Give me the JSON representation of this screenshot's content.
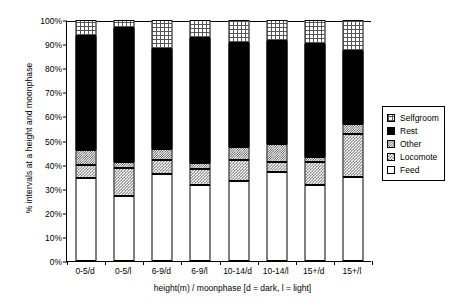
{
  "chart_data": {
    "type": "bar",
    "stacked": true,
    "title": "",
    "xlabel": "height(m) / moonphase [d = dark, l = light]",
    "ylabel": "% intervals at a height and moonphase",
    "ylim": [
      0,
      100
    ],
    "ytick_labels": [
      "0%",
      "10%",
      "20%",
      "30%",
      "40%",
      "50%",
      "60%",
      "70%",
      "80%",
      "90%",
      "100%"
    ],
    "ytick_values": [
      0,
      10,
      20,
      30,
      40,
      50,
      60,
      70,
      80,
      90,
      100
    ],
    "grid": false,
    "legend_position": "right",
    "categories": [
      "0-5/d",
      "0-5/l",
      "6-9/d",
      "6-9/l",
      "10-14/d",
      "10-14/l",
      "15+/d",
      "15+/l"
    ],
    "series": [
      {
        "name": "Feed",
        "order": 1,
        "pattern": "open-white",
        "values": [
          34.5,
          27.0,
          36.0,
          31.5,
          33.0,
          37.0,
          31.5,
          35.0
        ]
      },
      {
        "name": "Locomote",
        "order": 2,
        "pattern": "light-checker",
        "values": [
          5.5,
          11.5,
          6.0,
          6.5,
          9.0,
          4.0,
          9.5,
          17.5
        ]
      },
      {
        "name": "Other",
        "order": 3,
        "pattern": "dark-checker",
        "values": [
          6.0,
          2.5,
          4.5,
          2.5,
          5.5,
          7.5,
          2.0,
          4.5
        ]
      },
      {
        "name": "Rest",
        "order": 4,
        "pattern": "solid-black",
        "values": [
          47.4,
          55.5,
          41.5,
          52.0,
          43.0,
          43.0,
          47.0,
          30.0
        ]
      },
      {
        "name": "Selfgroom",
        "order": 5,
        "pattern": "grid-crosshatch",
        "values": [
          6.6,
          3.5,
          12.0,
          7.5,
          9.5,
          8.5,
          10.0,
          13.0
        ]
      }
    ]
  },
  "legend": {
    "items": [
      {
        "label": "Selfgroom",
        "swatch": "grid-crosshatch"
      },
      {
        "label": "Rest",
        "swatch": "solid-black"
      },
      {
        "label": "Other",
        "swatch": "dark-checker"
      },
      {
        "label": "Locomote",
        "swatch": "light-checker"
      },
      {
        "label": "Feed",
        "swatch": "open-white"
      }
    ]
  }
}
